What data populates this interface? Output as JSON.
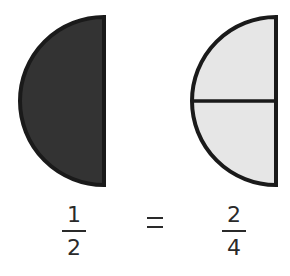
{
  "diagram": {
    "colors": {
      "shaded_fill": "#333333",
      "light_fill": "#e6e6e6",
      "stroke": "#1a1a1a",
      "text": "#2a2a2a"
    },
    "left_shape": {
      "type": "half-circle",
      "parts": 1,
      "shaded_parts": 1,
      "fill": "dark"
    },
    "right_shape": {
      "type": "half-circle",
      "parts": 2,
      "shaded_parts": 0,
      "fill": "light",
      "divider": "horizontal"
    },
    "equation": {
      "left": {
        "numerator": "1",
        "denominator": "2"
      },
      "operator": "=",
      "right": {
        "numerator": "2",
        "denominator": "4"
      }
    }
  }
}
